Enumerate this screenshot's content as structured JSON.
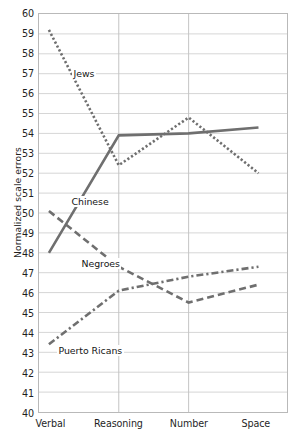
{
  "chart_data": {
    "type": "line",
    "title": "",
    "xlabel": "",
    "ylabel": "Normalized scale errors",
    "categories": [
      "Verbal",
      "Reasoning",
      "Number",
      "Space"
    ],
    "ylim": [
      40,
      60
    ],
    "ytick_step": 1,
    "yticks": [
      60,
      59,
      58,
      57,
      56,
      55,
      54,
      53,
      52,
      51,
      50,
      49,
      48,
      47,
      46,
      45,
      44,
      43,
      42,
      41,
      40
    ],
    "grid": true,
    "legend_position": "inline-labels",
    "line_color": "#6f6f6f",
    "grid_color": "#d6d6d6",
    "axis_color": "#b9b9b9",
    "background": "#ffffff",
    "series": [
      {
        "name": "Jews",
        "label": "Jews",
        "style": "dotted",
        "values": [
          59.2,
          52.4,
          54.8,
          52.0
        ],
        "label_x": 72,
        "label_y": 68
      },
      {
        "name": "Chinese",
        "label": "Chinese",
        "style": "solid",
        "values": [
          48.0,
          53.9,
          54.0,
          54.3
        ],
        "label_x": 70,
        "label_y": 196
      },
      {
        "name": "Negroes",
        "label": "Negroes",
        "style": "dashed",
        "values": [
          50.1,
          47.3,
          45.5,
          46.4
        ],
        "label_x": 80,
        "label_y": 258
      },
      {
        "name": "Puerto Ricans",
        "label": "Puerto Ricans",
        "style": "dash-dot",
        "values": [
          43.4,
          46.1,
          46.8,
          47.3
        ],
        "label_x": 57,
        "label_y": 345
      }
    ]
  }
}
